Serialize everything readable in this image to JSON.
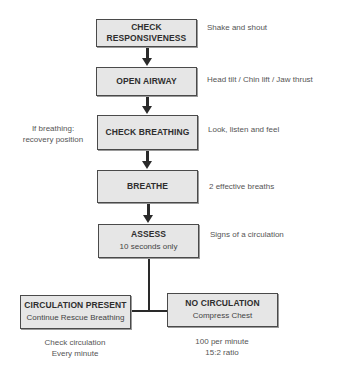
{
  "flowchart": {
    "steps": [
      {
        "title": "CHECK RESPONSIVENESS",
        "title_line1": "CHECK",
        "title_line2": "RESPONSIVENESS",
        "note": "Shake and shout"
      },
      {
        "title": "OPEN AIRWAY",
        "note": "Head tilt / Chin lift / Jaw thrust"
      },
      {
        "title": "CHECK BREATHING",
        "note": "Look, listen and feel",
        "left_note_line1": "If breathing:",
        "left_note_line2": "recovery position"
      },
      {
        "title": "BREATHE",
        "note": "2 effective breaths"
      },
      {
        "title": "ASSESS",
        "subtitle": "10 seconds only",
        "note": "Signs of a circulation"
      }
    ],
    "branches": {
      "left": {
        "title": "CIRCULATION PRESENT",
        "subtitle": "Continue Rescue Breathing",
        "note_line1": "Check circulation",
        "note_line2": "Every minute"
      },
      "right": {
        "title": "NO CIRCULATION",
        "subtitle": "Compress Chest",
        "note_line1": "100 per minute",
        "note_line2": "15:2 ratio"
      }
    }
  },
  "colors": {
    "box_fill": "#e6e6e6",
    "box_border": "#4a4a4a",
    "connector": "#2a2a2a",
    "text": "#3a3a3a"
  }
}
